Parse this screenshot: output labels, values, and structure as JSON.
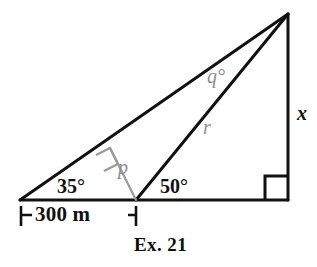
{
  "figure": {
    "caption": "Ex. 21",
    "base_dimension": "300 m",
    "angles": {
      "left": "35°",
      "middle": "50°",
      "right_angle_marker": "right-angle-square"
    },
    "segment_labels": {
      "height": "x",
      "slant": "r",
      "altitude": "p",
      "upper_angle": "q°"
    },
    "colors": {
      "ink": "#111111",
      "gray": "#8d8d8d",
      "background": "#ffffff"
    },
    "geometry": {
      "vertex_left": [
        20,
        200
      ],
      "vertex_mid_base": [
        136,
        200
      ],
      "vertex_right_base": [
        288,
        200
      ],
      "vertex_apex": [
        288,
        14
      ],
      "altitude_foot_on_upper_line": [
        110,
        148
      ],
      "dimension_line_y": 215
    }
  }
}
